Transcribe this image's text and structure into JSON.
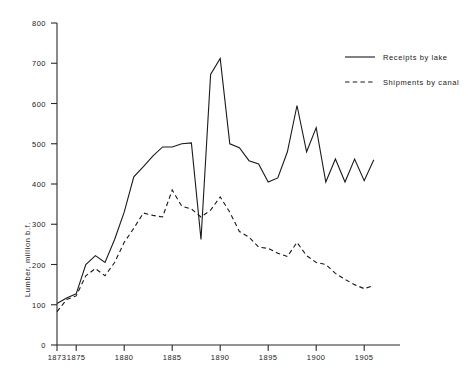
{
  "chart_data": {
    "type": "line",
    "title": "",
    "subtitle": "",
    "xlabel": "",
    "ylabel": "Lumber, million b.f.",
    "xlim": [
      1873,
      1906
    ],
    "ylim": [
      0,
      800
    ],
    "ytick_values": [
      0,
      100,
      200,
      300,
      400,
      500,
      600,
      700,
      800
    ],
    "ytick_labels": [
      "0",
      "100",
      "200",
      "300",
      "400",
      "500",
      "600",
      "700",
      "800"
    ],
    "xtick_values": [
      1873,
      1875,
      1880,
      1885,
      1890,
      1895,
      1900,
      1905
    ],
    "xtick_labels": [
      "1873",
      "1875",
      "1880",
      "1885",
      "1890",
      "1895",
      "1900",
      "1905"
    ],
    "grid": false,
    "legend_position": "top-right",
    "x": [
      1873,
      1874,
      1875,
      1876,
      1877,
      1878,
      1879,
      1880,
      1881,
      1882,
      1883,
      1884,
      1885,
      1886,
      1887,
      1888,
      1889,
      1890,
      1891,
      1892,
      1893,
      1894,
      1895,
      1896,
      1897,
      1898,
      1899,
      1900,
      1901,
      1902,
      1903,
      1904,
      1905,
      1906
    ],
    "series": [
      {
        "name": "Receipts by lake",
        "style": "solid",
        "values": [
          103,
          117,
          127,
          200,
          222,
          205,
          262,
          330,
          418,
          443,
          470,
          492,
          492,
          500,
          502,
          262,
          672,
          712,
          500,
          490,
          458,
          450,
          405,
          415,
          480,
          595,
          480,
          540,
          405,
          462,
          405,
          462,
          408,
          460
        ]
      },
      {
        "name": "Shipments by canal",
        "style": "dashed",
        "values": [
          83,
          113,
          122,
          172,
          190,
          172,
          205,
          255,
          290,
          328,
          322,
          318,
          385,
          345,
          338,
          318,
          335,
          368,
          330,
          282,
          268,
          243,
          240,
          228,
          220,
          255,
          222,
          205,
          200,
          178,
          163,
          150,
          140,
          148
        ]
      }
    ],
    "annotations": []
  },
  "legend": {
    "entries": [
      {
        "label": "Receipts by lake",
        "style": "solid"
      },
      {
        "label": "Shipments by canal",
        "style": "dashed"
      }
    ]
  },
  "axes": {
    "y_title": "Lumber, million b.f.",
    "y_labels": [
      "800",
      "700",
      "600",
      "500",
      "400",
      "300",
      "200",
      "100",
      "0"
    ],
    "x_labels": [
      "1873",
      "1875",
      "1880",
      "1885",
      "1890",
      "1895",
      "1900",
      "1905"
    ]
  },
  "colors": {
    "ink": "#1a1a1a",
    "axis": "#2b2b2b",
    "background": "#ffffff"
  }
}
